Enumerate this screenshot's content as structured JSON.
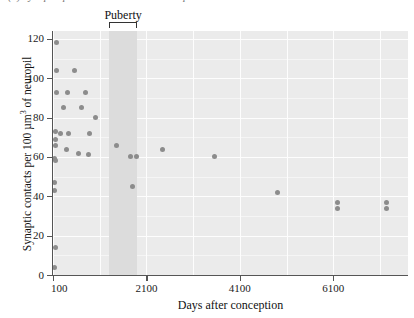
{
  "caption": {
    "text": "(b)  Synaptic prevalence in human development"
  },
  "annotation": {
    "puberty_label": "Puberty",
    "puberty_start_day": 1300,
    "puberty_end_day": 1900
  },
  "chart_data": {
    "type": "scatter",
    "title": "",
    "xlabel": "Days after conception",
    "ylabel": "Synaptic contacts per 100 µm³ of neuropil",
    "ylabel_parts": {
      "before": "Synaptic contacts per 100 µm",
      "superscript": "3",
      "after": " of neuropil"
    },
    "xlim": [
      100,
      7700
    ],
    "ylim": [
      0,
      124
    ],
    "xticks": [
      100,
      2100,
      4100,
      6100
    ],
    "xtick_labels": [
      "100",
      "2100",
      "4100",
      "6100"
    ],
    "yticks": [
      0,
      20,
      40,
      60,
      80,
      100,
      120
    ],
    "ytick_labels": [
      "0",
      "20",
      "40",
      "60",
      "80",
      "100",
      "120"
    ],
    "grid": true,
    "legend": "none",
    "marker_color": "#8c8c8c",
    "plot_background": "#ebebeb",
    "band_color": "#dcdcdc",
    "points": [
      {
        "x": 180,
        "y": 118
      },
      {
        "x": 175,
        "y": 104
      },
      {
        "x": 560,
        "y": 104
      },
      {
        "x": 175,
        "y": 93
      },
      {
        "x": 420,
        "y": 93
      },
      {
        "x": 790,
        "y": 93
      },
      {
        "x": 330,
        "y": 85
      },
      {
        "x": 700,
        "y": 85
      },
      {
        "x": 1000,
        "y": 80
      },
      {
        "x": 150,
        "y": 73
      },
      {
        "x": 250,
        "y": 72
      },
      {
        "x": 440,
        "y": 72
      },
      {
        "x": 880,
        "y": 72
      },
      {
        "x": 160,
        "y": 69
      },
      {
        "x": 150,
        "y": 66
      },
      {
        "x": 380,
        "y": 64
      },
      {
        "x": 1450,
        "y": 66
      },
      {
        "x": 640,
        "y": 62
      },
      {
        "x": 860,
        "y": 61
      },
      {
        "x": 1750,
        "y": 60
      },
      {
        "x": 1890,
        "y": 60
      },
      {
        "x": 130,
        "y": 59
      },
      {
        "x": 150,
        "y": 58
      },
      {
        "x": 2450,
        "y": 64
      },
      {
        "x": 3550,
        "y": 60
      },
      {
        "x": 1800,
        "y": 45
      },
      {
        "x": 140,
        "y": 47
      },
      {
        "x": 140,
        "y": 43
      },
      {
        "x": 4900,
        "y": 42
      },
      {
        "x": 6200,
        "y": 37
      },
      {
        "x": 6200,
        "y": 34
      },
      {
        "x": 7250,
        "y": 37
      },
      {
        "x": 7250,
        "y": 34
      },
      {
        "x": 160,
        "y": 14
      },
      {
        "x": 130,
        "y": 4
      }
    ]
  }
}
